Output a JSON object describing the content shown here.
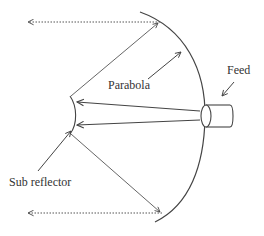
{
  "diagram": {
    "type": "Cassegrain antenna ray diagram",
    "labels": {
      "parabola": "Parabola",
      "feed": "Feed",
      "sub_reflector": "Sub reflector"
    },
    "components": [
      {
        "id": "parabola",
        "name": "Parabola",
        "shape": "curved main reflector"
      },
      {
        "id": "sub_reflector",
        "name": "Sub reflector",
        "shape": "small convex reflector"
      },
      {
        "id": "feed",
        "name": "Feed",
        "shape": "cylinder"
      }
    ],
    "rays": [
      {
        "from": "feed",
        "to": "sub_reflector",
        "style": "solid",
        "count": 2
      },
      {
        "from": "sub_reflector",
        "to": "parabola",
        "style": "thin solid",
        "count": 2
      },
      {
        "from": "parabola",
        "to": "outgoing (left)",
        "style": "dotted",
        "count": 2
      }
    ],
    "colors": {
      "stroke": "#444444",
      "text": "#333333",
      "background": "#ffffff"
    }
  }
}
